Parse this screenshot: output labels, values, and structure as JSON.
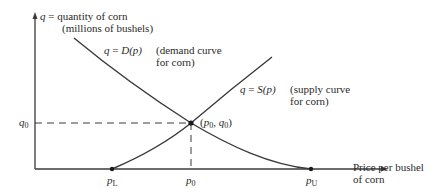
{
  "diagram": {
    "type": "supply-demand",
    "y_axis": {
      "label_var": "q",
      "label_eq": "=",
      "label_text": "quantity of corn",
      "label_units": "(millions of bushels)"
    },
    "x_axis": {
      "label_line1": "Price per bushel",
      "label_line2": "of corn"
    },
    "demand_curve": {
      "equation_lhs": "q",
      "equation_eq": "=",
      "equation_rhs": "D(p)",
      "desc_line1": "(demand curve",
      "desc_line2": "for corn)"
    },
    "supply_curve": {
      "equation_lhs": "q",
      "equation_eq": "=",
      "equation_rhs": "S(p)",
      "desc_line1": "(supply curve",
      "desc_line2": "for corn)"
    },
    "equilibrium": {
      "label_open": "(",
      "p_var": "p",
      "p_sub": "0",
      "sep": ", ",
      "q_var": "q",
      "q_sub": "0",
      "label_close": ")"
    },
    "ticks": {
      "q0_var": "q",
      "q0_sub": "0",
      "pL_var": "p",
      "pL_sub": "L",
      "p0_var": "p",
      "p0_sub": "0",
      "pU_var": "p",
      "pU_sub": "U"
    },
    "colors": {
      "line": "#3a3a3a",
      "text": "#2a2a2a",
      "background": "#ffffff"
    }
  }
}
